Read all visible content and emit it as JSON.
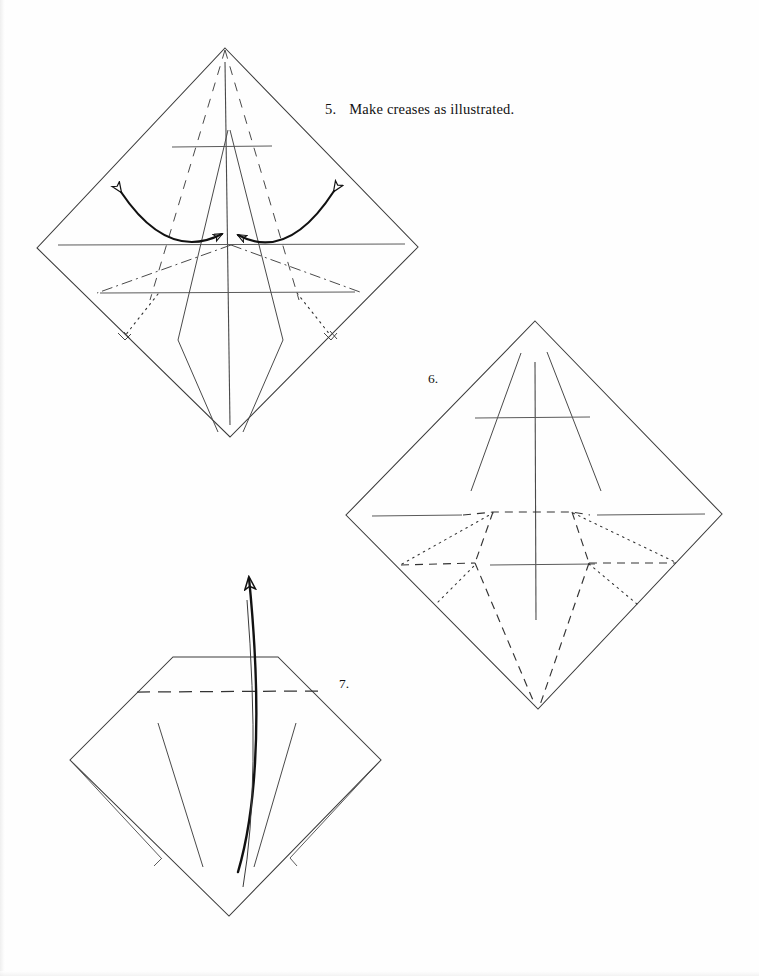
{
  "document": {
    "type": "origami-instruction-page",
    "background_color": "#fefefe",
    "ink_color": "#1a1a1a",
    "page_width": 759,
    "page_height": 976
  },
  "steps": [
    {
      "id": "step-5",
      "number": "5.",
      "text": "Make creases as illustrated.",
      "figure": "diamond-with-creases-and-arrows"
    },
    {
      "id": "step-6",
      "number": "6.",
      "text": "",
      "figure": "diamond-with-dashed-fold-pattern"
    },
    {
      "id": "step-7",
      "number": "7.",
      "text": "",
      "figure": "blunted-diamond-with-lift-arrow"
    }
  ],
  "figures": {
    "figure5": {
      "name": "diamond-step-5",
      "apex": [
        225,
        48
      ],
      "left": [
        37,
        248
      ],
      "right": [
        418,
        247
      ],
      "bottom": [
        230,
        437
      ],
      "crease_types": [
        "solid",
        "dashed",
        "dash-dot",
        "dotted"
      ],
      "arrows": [
        {
          "name": "left-double-arrow",
          "style": "double-headed-curved"
        },
        {
          "name": "right-double-arrow",
          "style": "double-headed-curved"
        }
      ],
      "right_angle_markers": 2
    },
    "figure6": {
      "name": "diamond-step-6",
      "apex": [
        535,
        321
      ],
      "left": [
        346,
        515
      ],
      "right": [
        722,
        514
      ],
      "bottom": [
        538,
        709
      ],
      "crease_types": [
        "solid",
        "dashed",
        "dotted"
      ],
      "arrows": [],
      "right_angle_markers": 0
    },
    "figure7": {
      "name": "blunted-diamond-step-7",
      "top_left": [
        173,
        657
      ],
      "top_right": [
        278,
        657
      ],
      "left": [
        70,
        760
      ],
      "right": [
        381,
        760
      ],
      "bottom": [
        229,
        916
      ],
      "crease_types": [
        "solid",
        "dashed"
      ],
      "arrows": [
        {
          "name": "lift-arrow",
          "style": "single-headed-curved-up"
        }
      ],
      "flaps": 2
    }
  }
}
